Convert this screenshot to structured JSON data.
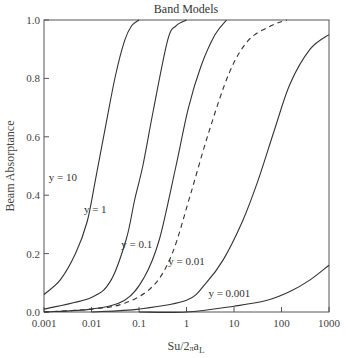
{
  "chart_data": {
    "type": "line",
    "title": "Band Models",
    "xlabel": "Su/2πa_L",
    "xlabel_main": "Su/2",
    "xlabel_pi": "π",
    "xlabel_a": "a",
    "xlabel_sub": "L",
    "ylabel": "Beam Absorptance",
    "xscale": "log",
    "xlim": [
      0.001,
      1000
    ],
    "ylim": [
      0.0,
      1.0
    ],
    "grid": false,
    "xticks": [
      "0.001",
      "0.01",
      "0.1",
      "1",
      "10",
      "100",
      "1000"
    ],
    "yticks": [
      "0.0",
      "0.2",
      "0.4",
      "0.6",
      "0.8",
      "1.0"
    ],
    "series": [
      {
        "name": "y = 10",
        "style": "solid",
        "x": [
          0.001,
          0.0022,
          0.0046,
          0.0081,
          0.012,
          0.02,
          0.032,
          0.05,
          0.07,
          0.1
        ],
        "y": [
          0.06,
          0.11,
          0.2,
          0.31,
          0.45,
          0.64,
          0.81,
          0.93,
          0.98,
          1.0
        ]
      },
      {
        "name": "y = 1",
        "style": "solid",
        "x": [
          0.001,
          0.01,
          0.026,
          0.054,
          0.08,
          0.12,
          0.2,
          0.4,
          0.6,
          1.0
        ],
        "y": [
          0.01,
          0.05,
          0.11,
          0.25,
          0.38,
          0.5,
          0.69,
          0.93,
          0.98,
          1.0
        ]
      },
      {
        "name": "y = 0.1",
        "style": "solid",
        "x": [
          0.001,
          0.01,
          0.05,
          0.13,
          0.27,
          0.6,
          1.1,
          2.0,
          4.0,
          7.0
        ],
        "y": [
          0.0,
          0.01,
          0.04,
          0.12,
          0.25,
          0.5,
          0.7,
          0.84,
          0.95,
          1.0
        ]
      },
      {
        "name": "dashed",
        "style": "dashed",
        "x": [
          0.001,
          0.01,
          0.05,
          0.2,
          0.5,
          1.2,
          3.0,
          8.0,
          20,
          60,
          130
        ],
        "y": [
          0.0,
          0.01,
          0.03,
          0.09,
          0.2,
          0.4,
          0.62,
          0.82,
          0.93,
          0.98,
          1.0
        ]
      },
      {
        "name": "y = 0.01",
        "style": "solid",
        "x": [
          0.01,
          0.1,
          1.0,
          2.6,
          6.0,
          15,
          32,
          70,
          150,
          400,
          1000
        ],
        "y": [
          0.0,
          0.01,
          0.04,
          0.1,
          0.18,
          0.31,
          0.45,
          0.62,
          0.78,
          0.9,
          0.95
        ]
      },
      {
        "name": "y = 0.001",
        "style": "solid",
        "x": [
          0.1,
          1.0,
          10,
          50,
          150,
          400,
          1000
        ],
        "y": [
          0.0,
          0.0,
          0.02,
          0.04,
          0.07,
          0.11,
          0.16
        ]
      }
    ],
    "annotations": [
      {
        "text": "y = 10",
        "x": 0.0025,
        "y": 0.45
      },
      {
        "text": "y = 1",
        "x": 0.012,
        "y": 0.34
      },
      {
        "text": "y = 0.1",
        "x": 0.09,
        "y": 0.22
      },
      {
        "text": "y = 0.01",
        "x": 1.0,
        "y": 0.16
      },
      {
        "text": "y = 0.001",
        "x": 8.0,
        "y": 0.05
      }
    ]
  }
}
